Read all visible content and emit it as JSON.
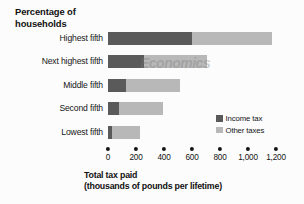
{
  "chart_data": {
    "type": "bar",
    "orientation": "horizontal",
    "stacked": true,
    "title": "Percentage of\nhouseholds",
    "xlabel": "Total tax paid\n(thousands of pounds per lifetime)",
    "ylabel": "",
    "categories": [
      "Highest fifth",
      "Next highest fifth",
      "Middle fifth",
      "Second fifth",
      "Lowest fifth"
    ],
    "series": [
      {
        "name": "Income tax",
        "color": "#5a5a5a",
        "values": [
          600,
          255,
          130,
          80,
          30
        ]
      },
      {
        "name": "Other taxes",
        "color": "#b8b8b8",
        "values": [
          570,
          450,
          385,
          315,
          200
        ]
      }
    ],
    "totals": [
      1170,
      705,
      515,
      395,
      230
    ],
    "xlim": [
      0,
      1200
    ],
    "xticks": [
      0,
      200,
      400,
      600,
      800,
      1000,
      1200
    ],
    "xticklabels": [
      "0",
      "200",
      "400",
      "600",
      "800",
      "1,000",
      "1,200"
    ],
    "grid": false,
    "legend_position": "right-inside",
    "tick_marker": "dot"
  },
  "legend": {
    "items": [
      {
        "label": "Income tax",
        "color": "#5a5a5a"
      },
      {
        "label": "Other taxes",
        "color": "#b8b8b8"
      }
    ]
  },
  "watermark": {
    "text": "Economics"
  },
  "colors": {
    "income_tax": "#5a5a5a",
    "other_taxes": "#b8b8b8",
    "text": "#151515",
    "background": "#fcfcfc"
  }
}
